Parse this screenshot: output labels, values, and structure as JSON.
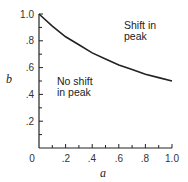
{
  "chart_data": {
    "type": "line",
    "title": "",
    "xlabel": "a",
    "ylabel": "b",
    "xlim": [
      0,
      1.0
    ],
    "ylim": [
      0,
      1.0
    ],
    "x_ticks": [
      "0",
      ".2",
      ".4",
      ".6",
      ".8",
      "1.0"
    ],
    "y_ticks": [
      ".2",
      ".4",
      ".6",
      ".8",
      "1.0"
    ],
    "grid": false,
    "series": [
      {
        "name": "boundary",
        "x": [
          0,
          0.1,
          0.2,
          0.3,
          0.4,
          0.5,
          0.6,
          0.7,
          0.8,
          0.9,
          1.0
        ],
        "values": [
          1.0,
          0.91,
          0.83,
          0.77,
          0.71,
          0.665,
          0.62,
          0.585,
          0.55,
          0.525,
          0.5
        ]
      }
    ],
    "annotations": [
      {
        "text": "Shift in\npeak",
        "x": 0.68,
        "y": 0.9
      },
      {
        "text": "No shift\nin peak",
        "x": 0.08,
        "y": 0.55
      }
    ]
  },
  "labels": {
    "xlabel": "a",
    "ylabel": "b",
    "region_upper_line1": "Shift in",
    "region_upper_line2": "peak",
    "region_lower_line1": "No shift",
    "region_lower_line2": "in peak",
    "x_ticks": [
      "0",
      ".2",
      ".4",
      ".6",
      ".8",
      "1.0"
    ],
    "y_ticks": [
      ".2",
      ".4",
      ".6",
      ".8",
      "1.0"
    ]
  }
}
